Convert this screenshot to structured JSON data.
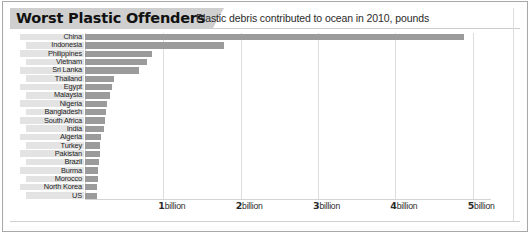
{
  "header": {
    "title": "Worst Plastic Offenders",
    "subtitle": "Plastic debris contributed to ocean in 2010, pounds"
  },
  "axis": {
    "ticks": [
      {
        "num": "1",
        "unit": "billion",
        "value": 1
      },
      {
        "num": "2",
        "unit": "billion",
        "value": 2
      },
      {
        "num": "3",
        "unit": "billion",
        "value": 3
      },
      {
        "num": "4",
        "unit": "billion",
        "value": 4
      },
      {
        "num": "5",
        "unit": "billion",
        "value": 5
      }
    ]
  },
  "colors": {
    "bar": "#9b9b9b",
    "title_plate": "#cfcfcf",
    "label_shade": "#e3e3e3",
    "gridline": "#dcdcdc",
    "frame": "#a8a8a8",
    "background": "#ffffff"
  },
  "chart_data": {
    "type": "bar",
    "orientation": "horizontal",
    "title": "Worst Plastic Offenders",
    "subtitle": "Plastic debris contributed to ocean in 2010, pounds",
    "xlabel": "",
    "ylabel": "",
    "xlim": [
      0,
      5.25
    ],
    "unit": "billion pounds",
    "grid": "vertical",
    "legend": "none",
    "categories": [
      "China",
      "Indonesia",
      "Philippines",
      "Vietnam",
      "Sri Lanka",
      "Thailand",
      "Egypt",
      "Malaysia",
      "Nigeria",
      "Bangladesh",
      "South Africa",
      "India",
      "Algeria",
      "Turkey",
      "Pakistan",
      "Brazil",
      "Burma",
      "Morocco",
      "North Korea",
      "US"
    ],
    "values": [
      4.9,
      1.8,
      0.87,
      0.8,
      0.7,
      0.38,
      0.35,
      0.32,
      0.29,
      0.27,
      0.26,
      0.25,
      0.21,
      0.2,
      0.19,
      0.18,
      0.17,
      0.165,
      0.16,
      0.155
    ]
  }
}
